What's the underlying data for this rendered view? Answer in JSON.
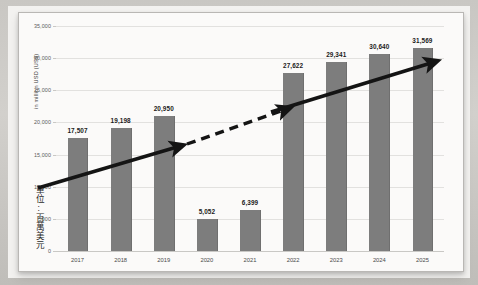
{
  "chart_data": {
    "type": "bar",
    "title": "",
    "subtitle": "",
    "xlabel": "",
    "ylabel": "in million USD (US$)",
    "ylabel_secondary": "單位:百萬美元",
    "categories": [
      "2017",
      "2018",
      "2019",
      "2020",
      "2021",
      "2022",
      "2023",
      "2024",
      "2025"
    ],
    "values": [
      17507,
      19198,
      20950,
      5052,
      6399,
      27622,
      29341,
      30640,
      31569
    ],
    "data_labels": [
      "17,507",
      "19,198",
      "20,950",
      "5,052",
      "6,399",
      "27,622",
      "29,341",
      "30,640",
      "31,569"
    ],
    "ylim": [
      0,
      35000
    ],
    "ytick_values": [
      35000,
      30000,
      25000,
      20000,
      15000,
      10000,
      5000,
      0
    ],
    "ytick_labels": [
      "35,000",
      "30,000",
      "25,000",
      "20,000",
      "15,000",
      "10,000",
      "5000",
      "0"
    ],
    "grid": true,
    "legend": "none",
    "bar_color": "#7d7d7d",
    "annotations": [
      {
        "name": "trend-arrow-1",
        "style": "solid",
        "from_year": "2017",
        "to_year": "2019",
        "description": "upward solid arrow over 2017-2019 bars"
      },
      {
        "name": "trend-arrow-2",
        "style": "dashed",
        "from_year": "2019",
        "to_year": "2022",
        "description": "upward dashed arrow bridging the 2020-2021 dip"
      },
      {
        "name": "trend-arrow-3",
        "style": "solid",
        "from_year": "2022",
        "to_year": "2025",
        "description": "upward solid arrow over 2022-2025 bars"
      }
    ]
  },
  "axis": {
    "y_title_en": "in million USD (US$)",
    "y_title_zh": "單位:百萬美元"
  },
  "colors": {
    "bar": "#7d7d7d",
    "gridline": "#e2e1df",
    "arrow": "#141414",
    "chart_background": "#fbfaf9",
    "page_background": "#f3f2f0"
  }
}
